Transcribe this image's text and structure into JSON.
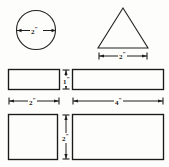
{
  "figure": {
    "background_color": "#fdfdfb",
    "ink_color": "#1a1a1a",
    "shapes": [
      {
        "id": "circle",
        "name": "circle",
        "dimension_label": "2",
        "unit": "\"",
        "dimension_type": "diameter",
        "cx": 36,
        "cy": 30,
        "r": 20
      },
      {
        "id": "triangle",
        "name": "triangle",
        "dimension_label": "2",
        "unit": "\"",
        "dimension_type": "base",
        "apex_x": 123,
        "apex_y": 8,
        "base_left_x": 98,
        "base_right_x": 148,
        "base_y": 48
      },
      {
        "id": "rectangle-small-top",
        "name": "small rectangle",
        "width_label": "2",
        "height_label": "1",
        "unit": "\"",
        "x": 8,
        "y": 69,
        "w": 52,
        "h": 21
      },
      {
        "id": "rectangle-wide-top",
        "name": "wide rectangle",
        "width_label": "4",
        "height_label": "1",
        "unit": "\"",
        "x": 72,
        "y": 69,
        "w": 92,
        "h": 21
      },
      {
        "id": "square-bottom",
        "name": "square",
        "width_label": "2",
        "height_label": "2",
        "unit": "\"",
        "x": 8,
        "y": 114,
        "w": 50,
        "h": 46
      },
      {
        "id": "rectangle-wide-bottom",
        "name": "wide rectangle bottom",
        "width_label": "4",
        "height_label": "2",
        "unit": "\"",
        "x": 72,
        "y": 114,
        "w": 92,
        "h": 46
      }
    ],
    "dimensions": {
      "circle_diameter": {
        "value": "2",
        "unit": "\""
      },
      "triangle_base": {
        "value": "2",
        "unit": "\""
      },
      "top_left_width": {
        "value": "2",
        "unit": "\""
      },
      "top_right_width": {
        "value": "4",
        "unit": "\""
      },
      "top_height": {
        "value": "1",
        "unit": "\""
      },
      "bottom_height": {
        "value": "2",
        "unit": "\""
      }
    }
  }
}
